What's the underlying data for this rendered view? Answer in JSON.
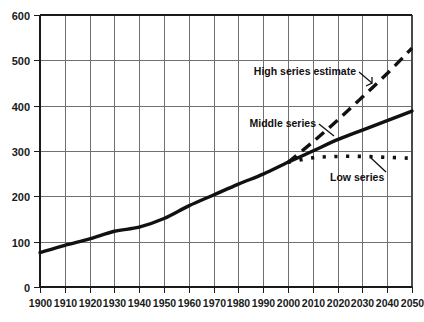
{
  "chart_data": {
    "type": "line",
    "title": "",
    "subtitle": "",
    "xlabel": "",
    "ylabel": "",
    "xlim": [
      1900,
      2050
    ],
    "ylim": [
      0,
      600
    ],
    "grid": true,
    "legend_position": "inline-annotations",
    "x_ticks": [
      1900,
      1910,
      1920,
      1930,
      1940,
      1950,
      1960,
      1970,
      1980,
      1990,
      2000,
      2010,
      2020,
      2030,
      2040,
      2050
    ],
    "x_tick_labels": [
      "1900",
      "1910",
      "1920",
      "1930",
      "1940",
      "1950",
      "1960",
      "1970",
      "1980",
      "1990",
      "2000",
      "2010",
      "2020",
      "2030",
      "2040",
      "2050"
    ],
    "y_ticks": [
      0,
      100,
      200,
      300,
      400,
      500,
      600
    ],
    "y_tick_labels": [
      "0",
      "100",
      "200",
      "300",
      "400",
      "500",
      "600"
    ],
    "series": [
      {
        "name": "Middle series",
        "style": "solid",
        "color": "#111111",
        "x": [
          1900,
          1910,
          1920,
          1930,
          1940,
          1950,
          1960,
          1970,
          1980,
          1990,
          2000,
          2010,
          2020,
          2030,
          2040,
          2050
        ],
        "values": [
          76,
          92,
          106,
          123,
          132,
          151,
          179,
          203,
          227,
          249,
          275,
          300,
          325,
          346,
          367,
          388
        ]
      },
      {
        "name": "High series estimate",
        "style": "dashed",
        "color": "#111111",
        "x": [
          2000,
          2010,
          2020,
          2030,
          2040,
          2050
        ],
        "values": [
          275,
          320,
          368,
          419,
          471,
          527
        ]
      },
      {
        "name": "Low series",
        "style": "dotted",
        "color": "#111111",
        "x": [
          2000,
          2010,
          2020,
          2030,
          2040,
          2050
        ],
        "values": [
          275,
          285,
          288,
          288,
          286,
          284
        ]
      }
    ],
    "annotations": [
      {
        "text": "High series estimate",
        "target_x": 2017,
        "target_y": 352
      },
      {
        "text": "Middle series",
        "target_x": 2006,
        "target_y": 289
      },
      {
        "text": "Low series",
        "target_x": 2033,
        "target_y": 288
      }
    ]
  },
  "labels": {
    "high_series": "High series estimate",
    "middle_series": "Middle series",
    "low_series": "Low series"
  },
  "colors": {
    "ink": "#111111",
    "grid": "#6f6f6f",
    "background": "#ffffff"
  }
}
